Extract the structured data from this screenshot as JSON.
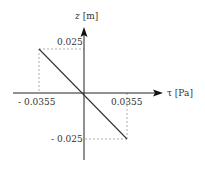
{
  "diagram": {
    "type": "linear stress-position plot",
    "y_axis": {
      "symbol": "z",
      "unit": "[m]"
    },
    "x_axis": {
      "symbol": "τ",
      "unit": "[Pa]"
    },
    "ticks": {
      "y_pos": "0.025",
      "y_neg": "- 0.025",
      "x_neg": "- 0.0355",
      "x_pos": "0.0355"
    },
    "line": {
      "from": {
        "tau": -0.0355,
        "z": 0.025
      },
      "to": {
        "tau": 0.0355,
        "z": -0.025
      }
    },
    "colors": {
      "axis": "#222222",
      "line": "#333333",
      "dashed": "#999999",
      "text": "#333333"
    }
  }
}
